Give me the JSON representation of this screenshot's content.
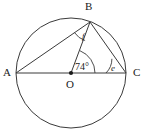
{
  "figure": {
    "type": "circle-geometry-diagram",
    "background_color": "#ffffff",
    "stroke_color": "#3a3a3a",
    "label_color": "#1a1a1a"
  },
  "points": {
    "A": {
      "label": "A",
      "x": 16,
      "y": 73,
      "on": "circle"
    },
    "B": {
      "label": "B",
      "x": 90,
      "y": 22,
      "on": "circle"
    },
    "C": {
      "label": "C",
      "x": 126,
      "y": 73,
      "on": "circle"
    },
    "O": {
      "label": "O",
      "x": 71,
      "y": 73,
      "on": "centre"
    }
  },
  "circle": {
    "center_x": 71,
    "center_y": 73,
    "radius": 55
  },
  "segments": [
    {
      "name": "diameter-AC",
      "from": "A",
      "to": "C"
    },
    {
      "name": "chord-AB",
      "from": "A",
      "to": "B"
    },
    {
      "name": "radius-OB",
      "from": "O",
      "to": "B"
    },
    {
      "name": "chord-BC",
      "from": "B",
      "to": "C"
    }
  ],
  "angles": {
    "center": {
      "label": "74°",
      "value": 74,
      "unit": "degrees",
      "at": "O",
      "between": "OB and OC"
    },
    "at_b": {
      "label": "f",
      "at": "B",
      "between": "BA and BO"
    },
    "at_c": {
      "label": "e",
      "at": "C",
      "between": "CB and CO"
    }
  }
}
